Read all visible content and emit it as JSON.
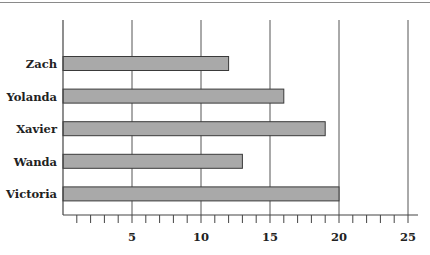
{
  "chart_data": {
    "type": "bar",
    "orientation": "horizontal",
    "title": "",
    "xlabel": "",
    "ylabel": "",
    "categories": [
      "Zach",
      "Yolanda",
      "Xavier",
      "Wanda",
      "Victoria"
    ],
    "values": [
      12,
      16,
      19,
      13,
      20
    ],
    "xlim": [
      0,
      25
    ],
    "major_ticks": [
      5,
      10,
      15,
      20,
      25
    ],
    "minor_tick_step": 1,
    "grid": "vertical at major ticks",
    "legend": null
  },
  "style": {
    "bar_fill": "#a9a9a9",
    "bar_stroke": "#3a3a3a",
    "grid_color": "#555555",
    "axis_color": "#444444",
    "text_color": "#222222"
  }
}
